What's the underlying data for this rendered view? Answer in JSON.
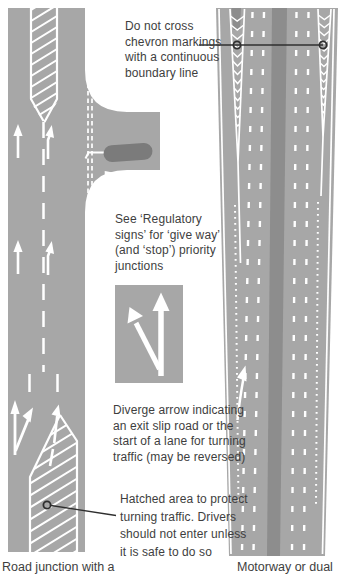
{
  "annotations": {
    "chevron_note": "Do not cross\nchevron markings\nwith a continuous\nboundary line",
    "regulatory_note": "See ‘Regulatory\nsigns’ for ‘give way’\n(and ‘stop’) priority\njunctions",
    "diverge_note": "Diverge arrow indicating\nan exit slip road or the\nstart of a lane for turning\ntraffic (may be reversed)",
    "hatched_note": "Hatched area to protect\nturning traffic. Drivers\nshould not enter unless\nit is safe to do so"
  },
  "captions": {
    "left": "Road junction with a",
    "right": "Motorway or dual"
  },
  "colors": {
    "road": "#a7a7a7",
    "median": "#8d8d8d",
    "island": "#7b7b7b",
    "marking": "#ffffff",
    "text": "#3e3e3e",
    "callout": "#2f2f2f"
  }
}
